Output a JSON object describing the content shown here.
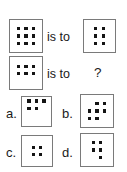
{
  "puzzle": {
    "type": "visual-analogy-dot-pattern",
    "relation_text_1": "is to",
    "relation_text_2": "is to",
    "question_mark": "?",
    "colors": {
      "background": "#ffffff",
      "box_border": "#7a7a7a",
      "dot": "#141414",
      "text": "#1a1a1a"
    },
    "premise": {
      "a": {
        "name": "premise-a",
        "dot_count": 9,
        "rows": 3,
        "cols": 3,
        "description": "3 by 3 full grid of 9 dots",
        "dots": [
          {
            "row": 1,
            "col": 1
          },
          {
            "row": 1,
            "col": 2
          },
          {
            "row": 1,
            "col": 3
          },
          {
            "row": 2,
            "col": 1
          },
          {
            "row": 2,
            "col": 2
          },
          {
            "row": 2,
            "col": 3
          },
          {
            "row": 3,
            "col": 1
          },
          {
            "row": 3,
            "col": 2
          },
          {
            "row": 3,
            "col": 3
          }
        ]
      },
      "b": {
        "name": "premise-b",
        "dot_count": 6,
        "rows": 3,
        "cols": 2,
        "description": "2 columns by 3 rows, 6 dots",
        "dots": [
          {
            "row": 1,
            "col": 1
          },
          {
            "row": 1,
            "col": 2
          },
          {
            "row": 2,
            "col": 1
          },
          {
            "row": 2,
            "col": 2
          },
          {
            "row": 3,
            "col": 1
          },
          {
            "row": 3,
            "col": 2
          }
        ]
      },
      "c": {
        "name": "premise-c",
        "dot_count": 6,
        "rows": 2,
        "cols": 3,
        "description": "3 columns by 2 rows, 6 dots, upper area of box",
        "dots": [
          {
            "row": 1,
            "col": 1
          },
          {
            "row": 1,
            "col": 2
          },
          {
            "row": 1,
            "col": 3
          },
          {
            "row": 2,
            "col": 1
          },
          {
            "row": 2,
            "col": 2
          },
          {
            "row": 2,
            "col": 3
          }
        ]
      }
    },
    "options": [
      {
        "key": "a",
        "label": "a.",
        "name": "option-a",
        "dot_count": 5,
        "description": "top row 3 dots, second row 2 dots left aligned",
        "dots": [
          {
            "row": 1,
            "col": 1
          },
          {
            "row": 1,
            "col": 2
          },
          {
            "row": 1,
            "col": 3
          },
          {
            "row": 2,
            "col": 1
          },
          {
            "row": 2,
            "col": 2
          }
        ]
      },
      {
        "key": "b",
        "label": "b.",
        "name": "option-b",
        "dot_count": 7,
        "description": "row 1 two dots right, row 2 three dots, row 3 two dots left",
        "dots": [
          {
            "row": 1,
            "col": 2
          },
          {
            "row": 1,
            "col": 3
          },
          {
            "row": 2,
            "col": 1
          },
          {
            "row": 2,
            "col": 2
          },
          {
            "row": 2,
            "col": 3
          },
          {
            "row": 3,
            "col": 1
          },
          {
            "row": 3,
            "col": 2
          }
        ]
      },
      {
        "key": "c",
        "label": "c.",
        "name": "option-c",
        "dot_count": 4,
        "description": "2 by 2 grid of 4 dots",
        "dots": [
          {
            "row": 1,
            "col": 1
          },
          {
            "row": 1,
            "col": 2
          },
          {
            "row": 2,
            "col": 1
          },
          {
            "row": 2,
            "col": 2
          }
        ]
      },
      {
        "key": "d",
        "label": "d.",
        "name": "option-d",
        "dot_count": 5,
        "description": "row 1 two dots, row 2 two dots, row 3 one dot on right",
        "dots": [
          {
            "row": 1,
            "col": 1
          },
          {
            "row": 1,
            "col": 2
          },
          {
            "row": 2,
            "col": 1
          },
          {
            "row": 2,
            "col": 2
          },
          {
            "row": 3,
            "col": 2
          }
        ]
      }
    ]
  }
}
